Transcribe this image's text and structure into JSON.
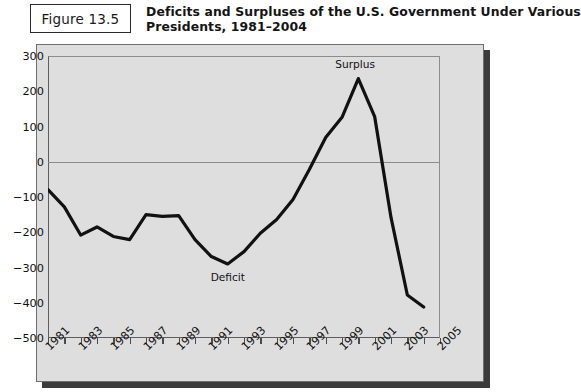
{
  "figure": {
    "number_label": "Figure 13.5",
    "title_line1": "Deficits and Surpluses of the U.S. Government Under Various",
    "title_line2": "Presidents, 1981–2004"
  },
  "chart_data": {
    "type": "line",
    "title": "Deficits and Surpluses of the U.S. Government Under Various Presidents, 1981–2004",
    "xlabel": "",
    "ylabel": "",
    "ylim": [
      -500,
      300
    ],
    "xlim": [
      1981,
      2005
    ],
    "ytick_step": 100,
    "grid": false,
    "legend": "none",
    "zero_line": 0,
    "yticks": [
      "300",
      "200",
      "100",
      "0",
      "−100",
      "−200",
      "−300",
      "−400",
      "−500"
    ],
    "ytick_values": [
      300,
      200,
      100,
      0,
      -100,
      -200,
      -300,
      -400,
      -500
    ],
    "xticks": [
      "1981",
      "1983",
      "1985",
      "1987",
      "1989",
      "1991",
      "1993",
      "1995",
      "1997",
      "1999",
      "2001",
      "2003",
      "2005"
    ],
    "xtick_values": [
      1981,
      1983,
      1985,
      1987,
      1989,
      1991,
      1993,
      1995,
      1997,
      1999,
      2001,
      2003,
      2005
    ],
    "x": [
      1981,
      1982,
      1983,
      1984,
      1985,
      1986,
      1987,
      1988,
      1989,
      1990,
      1991,
      1992,
      1993,
      1994,
      1995,
      1996,
      1997,
      1998,
      1999,
      2000,
      2001,
      2002,
      2003,
      2004
    ],
    "values": [
      -79,
      -128,
      -208,
      -185,
      -212,
      -221,
      -150,
      -155,
      -153,
      -221,
      -269,
      -290,
      -255,
      -203,
      -164,
      -107,
      -22,
      69,
      126,
      236,
      128,
      -158,
      -378,
      -412
    ],
    "series": [
      {
        "name": "Federal budget balance (billions of dollars)",
        "color": "#111111",
        "values": [
          -79,
          -128,
          -208,
          -185,
          -212,
          -221,
          -150,
          -155,
          -153,
          -221,
          -269,
          -290,
          -255,
          -203,
          -164,
          -107,
          -22,
          69,
          126,
          236,
          128,
          -158,
          -378,
          -412
        ]
      }
    ],
    "annotations": [
      {
        "text": "Surplus",
        "x": 2000,
        "y": 236,
        "position": "above"
      },
      {
        "text": "Deficit",
        "x": 1992,
        "y": -290,
        "position": "below"
      }
    ]
  }
}
